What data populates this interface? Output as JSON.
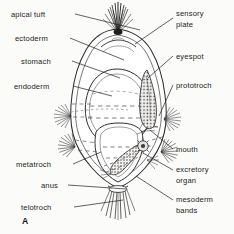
{
  "figure": {
    "panel_id": "A",
    "background_color": "#fbfbfa",
    "ink_color": "#2b2b2b"
  },
  "labels_left": [
    {
      "id": "apical-tuft",
      "text": "apical tuft",
      "x": 11,
      "y": 10,
      "leader": [
        [
          75,
          14
        ],
        [
          140,
          30
        ]
      ]
    },
    {
      "id": "ectoderm",
      "text": "ectoderm",
      "x": 15,
      "y": 34,
      "leader": [
        [
          70,
          38
        ],
        [
          124,
          60
        ]
      ]
    },
    {
      "id": "stomach",
      "text": "stomach",
      "x": 21,
      "y": 57,
      "leader": [
        [
          72,
          61
        ],
        [
          120,
          78
        ]
      ]
    },
    {
      "id": "endoderm",
      "text": "endoderm",
      "x": 14,
      "y": 82,
      "leader": [
        [
          73,
          86
        ],
        [
          112,
          96
        ]
      ]
    },
    {
      "id": "metatroch",
      "text": "metatroch",
      "x": 16,
      "y": 160,
      "leader": [
        [
          73,
          164
        ],
        [
          101,
          152
        ]
      ]
    },
    {
      "id": "anus",
      "text": "anus",
      "x": 41,
      "y": 181,
      "leader": [
        [
          68,
          185
        ],
        [
          126,
          189
        ]
      ]
    },
    {
      "id": "telotroch",
      "text": "telotroch",
      "x": 21,
      "y": 203,
      "leader": [
        [
          74,
          207
        ],
        [
          123,
          200
        ]
      ]
    }
  ],
  "labels_right": [
    {
      "id": "sensory-plate",
      "text": "sensory\nplate",
      "x": 176,
      "y": 9,
      "leader": [
        [
          173,
          18
        ],
        [
          135,
          44
        ]
      ]
    },
    {
      "id": "eyespot",
      "text": "eyespot",
      "x": 176,
      "y": 52,
      "leader": [
        [
          173,
          56
        ],
        [
          148,
          78
        ]
      ]
    },
    {
      "id": "prototroch",
      "text": "prototroch",
      "x": 176,
      "y": 81,
      "leader": [
        [
          173,
          85
        ],
        [
          159,
          116
        ]
      ]
    },
    {
      "id": "mouth",
      "text": "mouth",
      "x": 176,
      "y": 145,
      "leader": [
        [
          173,
          149
        ],
        [
          150,
          130
        ]
      ]
    },
    {
      "id": "excretory-organ",
      "text": "excretory\norgan",
      "x": 176,
      "y": 165,
      "leader": [
        [
          173,
          170
        ],
        [
          143,
          153
        ]
      ]
    },
    {
      "id": "mesoderm-bands",
      "text": "mesoderm\nbands",
      "x": 176,
      "y": 195,
      "leader": [
        [
          173,
          200
        ],
        [
          136,
          176
        ]
      ]
    }
  ]
}
